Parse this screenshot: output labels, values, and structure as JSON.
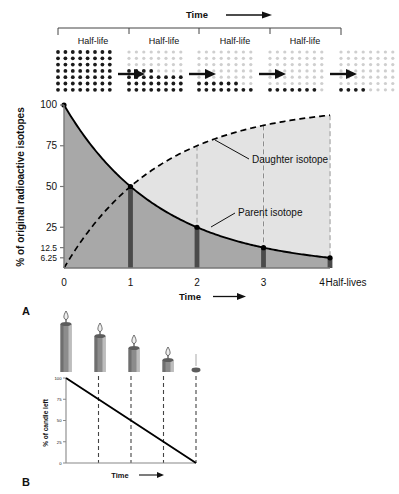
{
  "figure": {
    "panels": [
      {
        "letter": "A",
        "name": "radioactive-decay-panel"
      },
      {
        "letter": "B",
        "name": "candle-analogy-panel"
      }
    ]
  },
  "top_strip": {
    "time_label": "Time",
    "arrow": "right-arrow",
    "halflife_labels": [
      "Half-life",
      "Half-life",
      "Half-life",
      "Half-life"
    ],
    "dot_grids": [
      {
        "index": 0,
        "dark_dots": 56,
        "percent_remaining": 100
      },
      {
        "index": 1,
        "dark_dots": 28,
        "percent_remaining": 50
      },
      {
        "index": 2,
        "dark_dots": 14,
        "percent_remaining": 25
      },
      {
        "index": 3,
        "dark_dots": 7,
        "percent_remaining": 12.5
      },
      {
        "index": 4,
        "dark_dots": 4,
        "percent_remaining": 6.25
      }
    ],
    "grid_cols": 8,
    "grid_rows": 7
  },
  "chart_data": {
    "type": "line",
    "title": "",
    "xlabel": "Time",
    "ylabel": "% of original radioactive isotopes",
    "x_axis_suffix": "Half-lives",
    "xticks": [
      "0",
      "1",
      "2",
      "3",
      "4"
    ],
    "xtick_values": [
      0,
      1,
      2,
      3,
      4
    ],
    "yticks": [
      "100",
      "75",
      "50",
      "25",
      "12.5",
      "6.25"
    ],
    "ytick_values": [
      100,
      75,
      50,
      25,
      12.5,
      6.25
    ],
    "xlim": [
      0,
      4
    ],
    "ylim": [
      0,
      100
    ],
    "grid": false,
    "legend": "inline-annotations",
    "series": [
      {
        "name": "Parent isotope",
        "style": "solid",
        "x": [
          0,
          1,
          2,
          3,
          4
        ],
        "values": [
          100,
          50,
          25,
          12.5,
          6.25
        ],
        "fill": "#a8a8a8"
      },
      {
        "name": "Daughter isotope",
        "style": "dashed",
        "x": [
          0,
          1,
          2,
          3,
          4
        ],
        "values": [
          0,
          50,
          75,
          87.5,
          93.75
        ],
        "fill": "#e2e2e2"
      }
    ],
    "annotations": [
      {
        "text": "Daughter isotope",
        "name": "daughter-isotope-label"
      },
      {
        "text": "Parent isotope",
        "name": "parent-isotope-label"
      }
    ],
    "marker_bars_at": [
      1,
      2,
      3,
      4
    ]
  },
  "candle_chart": {
    "type": "line",
    "xlabel": "Time",
    "ylabel": "% of candle left",
    "yticks": [
      "100",
      "75",
      "50",
      "25",
      "0"
    ],
    "ytick_values": [
      100,
      75,
      50,
      25,
      0
    ],
    "xlim": [
      0,
      4
    ],
    "ylim": [
      0,
      100
    ],
    "grid": false,
    "series": [
      {
        "name": "Candle remaining",
        "style": "solid",
        "x": [
          0,
          1,
          2,
          3,
          4
        ],
        "values": [
          100,
          75,
          50,
          25,
          0
        ]
      }
    ],
    "dashed_verticals_at": [
      1,
      2,
      3,
      4
    ],
    "candles": [
      {
        "index": 0,
        "percent_left": 100,
        "lit": true
      },
      {
        "index": 1,
        "percent_left": 75,
        "lit": true
      },
      {
        "index": 2,
        "percent_left": 50,
        "lit": true
      },
      {
        "index": 3,
        "percent_left": 25,
        "lit": true
      },
      {
        "index": 4,
        "percent_left": 0,
        "lit": false
      }
    ]
  },
  "colors": {
    "parent_fill": "#a8a8a8",
    "daughter_fill": "#e3e3e3",
    "bar_dark": "#4a4a4a",
    "line": "#000000",
    "dot_dark": "#1a1a1a",
    "dot_light": "#cfcfcf",
    "axis": "#777777",
    "candle_body": "#8c8c8c",
    "candle_dark": "#5c5c5c"
  }
}
